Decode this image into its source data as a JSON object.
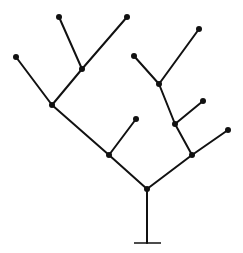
{
  "diagram": {
    "type": "tree",
    "stroke_color": "#111111",
    "node_color": "#111111",
    "stroke_width": 2,
    "node_radius": 3,
    "base": {
      "x1": 134,
      "x2": 161,
      "y": 243
    },
    "nodes": [
      {
        "id": "root",
        "x": 147,
        "y": 189
      },
      {
        "id": "n1",
        "x": 109,
        "y": 155
      },
      {
        "id": "n2",
        "x": 192,
        "y": 155
      },
      {
        "id": "n3",
        "x": 52,
        "y": 105
      },
      {
        "id": "n4",
        "x": 82,
        "y": 69
      },
      {
        "id": "n5",
        "x": 175,
        "y": 124
      },
      {
        "id": "n6",
        "x": 159,
        "y": 84
      },
      {
        "id": "leaf1",
        "x": 16,
        "y": 57
      },
      {
        "id": "leaf2",
        "x": 59,
        "y": 17
      },
      {
        "id": "leaf3",
        "x": 127,
        "y": 17
      },
      {
        "id": "leaf4",
        "x": 136,
        "y": 119
      },
      {
        "id": "leaf5",
        "x": 228,
        "y": 130
      },
      {
        "id": "leaf6",
        "x": 203,
        "y": 101
      },
      {
        "id": "leaf7",
        "x": 134,
        "y": 56
      },
      {
        "id": "leaf8",
        "x": 199,
        "y": 29
      }
    ],
    "edges": [
      [
        "root",
        "n1"
      ],
      [
        "root",
        "n2"
      ],
      [
        "n1",
        "n3"
      ],
      [
        "n1",
        "leaf4"
      ],
      [
        "n3",
        "leaf1"
      ],
      [
        "n3",
        "n4"
      ],
      [
        "n4",
        "leaf2"
      ],
      [
        "n4",
        "leaf3"
      ],
      [
        "n2",
        "leaf5"
      ],
      [
        "n2",
        "n5"
      ],
      [
        "n5",
        "leaf6"
      ],
      [
        "n5",
        "n6"
      ],
      [
        "n6",
        "leaf7"
      ],
      [
        "n6",
        "leaf8"
      ]
    ]
  }
}
